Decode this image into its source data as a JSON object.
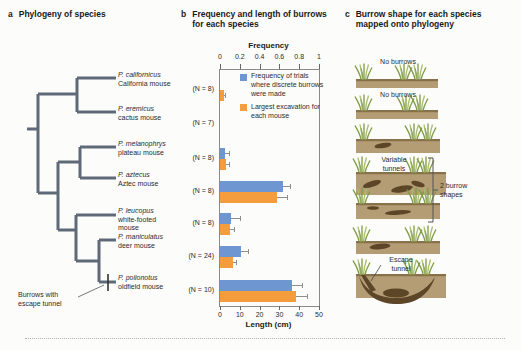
{
  "figure": {
    "panels": [
      {
        "letter": "a",
        "title": "Phylogeny of species"
      },
      {
        "letter": "b",
        "title": "Frequency and length of burrows for each species"
      },
      {
        "letter": "c",
        "title": "Burrow shape for each species mapped onto phylogeny"
      }
    ]
  },
  "panel_a": {
    "species": [
      {
        "latin": "P. californicus",
        "common": "California mouse"
      },
      {
        "latin": "P. eremicus",
        "common": "cactus mouse"
      },
      {
        "latin": "P. melanophrys",
        "common": "plateau mouse"
      },
      {
        "latin": "P. aztecus",
        "common": "Aztec mouse"
      },
      {
        "latin": "P. leucopus",
        "common": "white-footed mouse"
      },
      {
        "latin": "P. maniculatus",
        "common": "deer mouse"
      },
      {
        "latin": "P. polionotus",
        "common": "oldfield mouse"
      }
    ],
    "annotation": "Burrows with escape tunnel"
  },
  "panel_b": {
    "n_labels": [
      "(N = 8)",
      "(N = 7)",
      "(N = 8)",
      "(N = 8)",
      "(N = 8)",
      "(N = 24)",
      "(N = 10)"
    ],
    "legend": [
      {
        "label": "Frequency of trials where discrete burrows were made",
        "color": "#6e96d0"
      },
      {
        "label": "Largest excavation for each mouse",
        "color": "#f59c3c"
      }
    ]
  },
  "chart_data": {
    "type": "bar",
    "orientation": "horizontal",
    "title": "Frequency and length of burrows for each species",
    "categories": [
      "P. californicus",
      "P. eremicus",
      "P. melanophrys",
      "P. aztecus",
      "P. leucopus",
      "P. maniculatus",
      "P. polionotus"
    ],
    "sample_sizes": [
      8,
      7,
      8,
      8,
      8,
      24,
      10
    ],
    "series": [
      {
        "name": "Frequency of trials where discrete burrows were made",
        "axis": "frequency",
        "color": "#6e96d0",
        "values": [
          0,
          0,
          0.05,
          0.64,
          0.11,
          0.21,
          0.73
        ],
        "errors": [
          0,
          0,
          0.04,
          0.07,
          0.09,
          0.07,
          0.1
        ]
      },
      {
        "name": "Largest excavation for each mouse",
        "axis": "length_cm",
        "color": "#f59c3c",
        "values": [
          2,
          0,
          3,
          29,
          5,
          6.5,
          38.5
        ],
        "errors": [
          0.5,
          0,
          1.5,
          5,
          2,
          1.5,
          5.5
        ]
      }
    ],
    "axes": {
      "top": {
        "label": "Frequency",
        "ticks": [
          "0",
          "0.2",
          "0.4",
          "0.6",
          "0.8",
          "1"
        ],
        "tick_values": [
          0,
          0.2,
          0.4,
          0.6,
          0.8,
          1
        ],
        "range": [
          0,
          1
        ]
      },
      "bottom": {
        "label": "Length (cm)",
        "ticks": [
          "0",
          "10",
          "20",
          "30",
          "40",
          "50"
        ],
        "tick_values": [
          0,
          10,
          20,
          30,
          40,
          50
        ],
        "range": [
          0,
          50
        ]
      }
    },
    "grid": false,
    "legend_position": "top-inside"
  },
  "panel_c": {
    "row_labels": [
      "No burrows",
      "No burrows",
      "",
      "Variable tunnels",
      "",
      "",
      "Escape tunnel"
    ],
    "bracket_label": "2 burrow shapes"
  },
  "colors": {
    "bar_blue": "#6e96d0",
    "bar_orange": "#f59c3c",
    "tree_branch": "#5f6a78",
    "soil": "#b49c74",
    "soil_top": "#87714b",
    "burrow": "#5d4527",
    "grass_dark": "#7d9a43",
    "grass_light": "#a9bd6e",
    "background": "#fcfcfa"
  }
}
